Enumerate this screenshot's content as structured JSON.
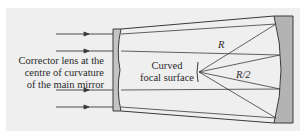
{
  "diagram": {
    "type": "schmidt-telescope-optics",
    "labels": {
      "corrector_line1": "Corrector lens at the",
      "corrector_line2": "centre of curvature",
      "corrector_line3": "of the main mirror",
      "focal_line1": "Curved",
      "focal_line2": "focal surface",
      "radius": "R",
      "half_radius": "R/2"
    },
    "colors": {
      "background": "#ffffff",
      "panel": "#efefef",
      "line": "#3a3a3a",
      "mirror_fill": "#b3b3b3",
      "corrector_fill": "#c4c4c4",
      "text": "#2a2a2a"
    },
    "incoming_ray_count": 4
  }
}
